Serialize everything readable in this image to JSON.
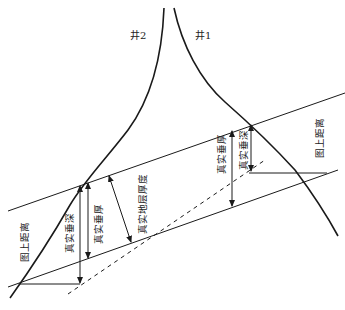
{
  "diagram": {
    "type": "geological-cross-section",
    "wells": [
      {
        "id": "well-1",
        "label": "井1"
      },
      {
        "id": "well-2",
        "label": "井2"
      }
    ],
    "labels": {
      "map_distance_left": "图上距离",
      "map_distance_right": "图上距离",
      "true_vertical_depth_left": "真实垂深",
      "true_vertical_thickness_left": "真实垂厚",
      "true_stratigraphic_thickness": "真实地层厚度",
      "true_vertical_thickness_right": "真实垂厚",
      "true_vertical_depth_right": "真实垂深"
    },
    "colors": {
      "line": "#1a1a1a",
      "background": "#ffffff"
    }
  }
}
